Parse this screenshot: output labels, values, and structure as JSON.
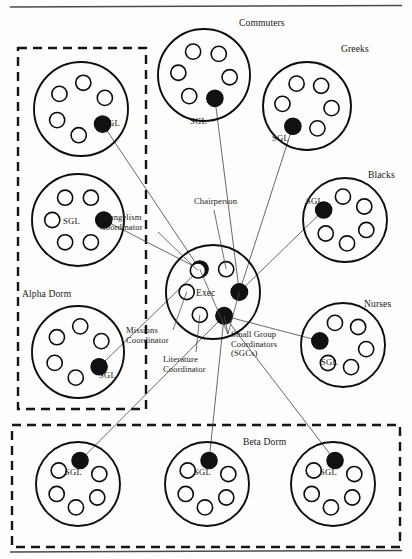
{
  "diagram": {
    "title_rules": {
      "top_rule": true,
      "bottom_rule": true
    },
    "member_label": "SGL",
    "exec_label": "Exec",
    "group_boxes": [
      {
        "id": "alpha-dorm",
        "label": "Alpha Dorm",
        "label_x": 22,
        "label_y": 289,
        "x": 18,
        "y": 48,
        "w": 128,
        "h": 361
      },
      {
        "id": "beta-dorm",
        "label": "Beta Dorm",
        "label_x": 243,
        "label_y": 437,
        "x": 12,
        "y": 425,
        "w": 388,
        "h": 122
      }
    ],
    "groups": [
      {
        "id": "alpha-1",
        "label": "",
        "label_x": 0,
        "label_y": 0,
        "cx": 81,
        "cy": 109,
        "r": 47,
        "leader_angle": 35,
        "sgl_x": 103,
        "sgl_y": 118
      },
      {
        "id": "alpha-2",
        "label": "",
        "label_x": 0,
        "label_y": 0,
        "cx": 78,
        "cy": 220,
        "r": 46,
        "leader_angle": 0,
        "sgl_x": 63,
        "sgl_y": 216
      },
      {
        "id": "alpha-3",
        "label": "",
        "label_x": 0,
        "label_y": 0,
        "cx": 78,
        "cy": 352,
        "r": 46,
        "leader_angle": 35,
        "sgl_x": 99,
        "sgl_y": 370
      },
      {
        "id": "commuters",
        "label": "Commuters",
        "label_x": 239,
        "label_y": 18,
        "cx": 204,
        "cy": 75,
        "r": 46,
        "leader_angle": 65,
        "sgl_x": 190,
        "sgl_y": 116
      },
      {
        "id": "greeks",
        "label": "Greeks",
        "label_x": 341,
        "label_y": 44,
        "cx": 307,
        "cy": 106,
        "r": 44,
        "leader_angle": 125,
        "sgl_x": 272,
        "sgl_y": 133
      },
      {
        "id": "blacks",
        "label": "Blacks",
        "label_x": 368,
        "label_y": 170,
        "cx": 345,
        "cy": 220,
        "r": 42,
        "leader_angle": 205,
        "sgl_x": 306,
        "sgl_y": 196
      },
      {
        "id": "nurses",
        "label": "Nurses",
        "label_x": 364,
        "label_y": 299,
        "cx": 343,
        "cy": 345,
        "r": 42,
        "leader_angle": 190,
        "sgl_x": 321,
        "sgl_y": 357
      },
      {
        "id": "beta-1",
        "label": "",
        "label_x": 0,
        "label_y": 0,
        "cx": 78,
        "cy": 484,
        "r": 42,
        "leader_angle": 275,
        "sgl_x": 65,
        "sgl_y": 467
      },
      {
        "id": "beta-2",
        "label": "",
        "label_x": 0,
        "label_y": 0,
        "cx": 207,
        "cy": 484,
        "r": 42,
        "leader_angle": 275,
        "sgl_x": 194,
        "sgl_y": 467
      },
      {
        "id": "beta-3",
        "label": "",
        "label_x": 0,
        "label_y": 0,
        "cx": 333,
        "cy": 484,
        "r": 42,
        "leader_angle": 275,
        "sgl_x": 320,
        "sgl_y": 467
      }
    ],
    "exec": {
      "cx": 213,
      "cy": 292,
      "r": 47,
      "label_x": 196,
      "label_y": 288,
      "seats": [
        {
          "role": "small-group-coordinator",
          "filled": true,
          "angle": 240
        },
        {
          "role": "chairperson",
          "filled": false,
          "angle": 300
        },
        {
          "role": "small-group-coordinator",
          "filled": true,
          "angle": 0
        },
        {
          "role": "small-group-coordinator",
          "filled": true,
          "angle": 65
        },
        {
          "role": "literature-coordinator",
          "filled": false,
          "angle": 120
        },
        {
          "role": "missions-coordinator",
          "filled": false,
          "angle": 180
        },
        {
          "role": "evangelism-coordinator",
          "filled": false,
          "angle": 235
        }
      ]
    },
    "annotations": [
      {
        "id": "chairperson",
        "text": "Chairperson",
        "x": 194,
        "y": 197,
        "align": "left"
      },
      {
        "id": "evangelism-coordinator",
        "text": "Evangelism\nCoordinator",
        "x": 100,
        "y": 213,
        "align": "left"
      },
      {
        "id": "missions-coordinator",
        "text": "Missions\nCoordinator",
        "x": 126,
        "y": 326,
        "align": "left"
      },
      {
        "id": "literature-coordinator",
        "text": "Literature\nCoordinator",
        "x": 163,
        "y": 355,
        "align": "left"
      },
      {
        "id": "small-group-coordinators",
        "text": "Small Group\nCoordinators\n(SGCs)",
        "x": 231,
        "y": 330,
        "align": "left"
      }
    ]
  }
}
